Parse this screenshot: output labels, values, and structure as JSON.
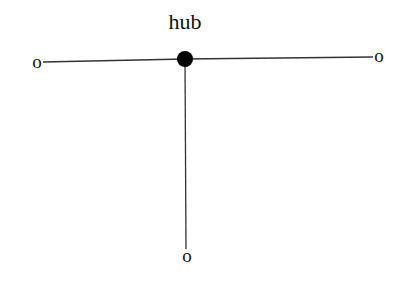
{
  "diagram": {
    "type": "star-topology",
    "hub": {
      "label": "hub",
      "x": 185,
      "y": 59,
      "r": 8,
      "color": "#000000"
    },
    "leaves": [
      {
        "id": "left",
        "label": "o",
        "x": 37,
        "y": 63
      },
      {
        "id": "right",
        "label": "o",
        "x": 379,
        "y": 57
      },
      {
        "id": "bottom",
        "label": "o",
        "x": 187,
        "y": 257
      }
    ],
    "edge_color": "#333333"
  }
}
